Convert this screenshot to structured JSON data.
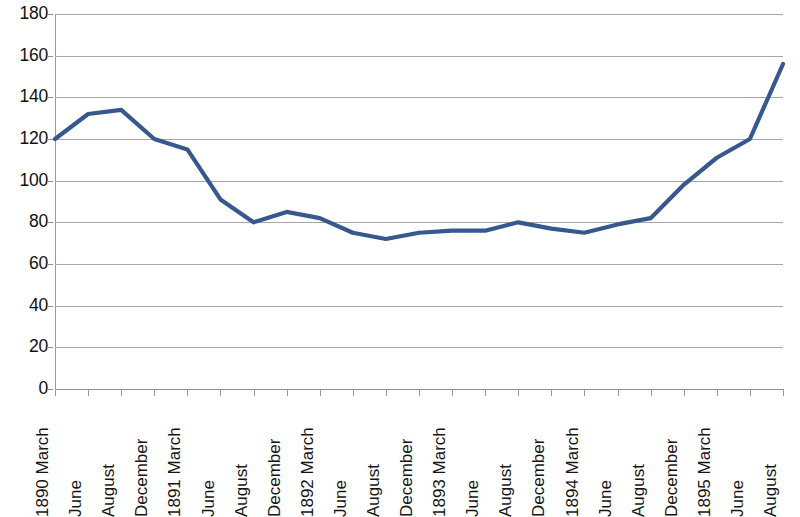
{
  "chart_data": {
    "type": "line",
    "title": "",
    "subtitle": "",
    "xlabel": "",
    "ylabel": "",
    "ylim": [
      0,
      180
    ],
    "ytick_step": 20,
    "yticks": [
      0,
      20,
      40,
      60,
      80,
      100,
      120,
      140,
      160,
      180
    ],
    "grid": true,
    "legend": "none",
    "line_color": "#36588f",
    "grid_color": "#a6a6a6",
    "axis_color": "#8f8f8f",
    "categories": [
      "1890 March",
      "June",
      "August",
      "December",
      "1891 March",
      "June",
      "August",
      "December",
      "1892 March",
      "June",
      "August",
      "December",
      "1893 March",
      "June",
      "August",
      "December",
      "1894 March",
      "June",
      "August",
      "December",
      "1895 March",
      "June",
      "August"
    ],
    "values": [
      120,
      132,
      134,
      120,
      115,
      91,
      80,
      85,
      82,
      75,
      72,
      75,
      76,
      76,
      80,
      77,
      75,
      79,
      82,
      98,
      111,
      120,
      156
    ],
    "series": [
      {
        "name": "",
        "values": [
          120,
          132,
          134,
          120,
          115,
          91,
          80,
          85,
          82,
          75,
          72,
          75,
          76,
          76,
          80,
          77,
          75,
          79,
          82,
          98,
          111,
          120,
          156
        ]
      }
    ]
  }
}
